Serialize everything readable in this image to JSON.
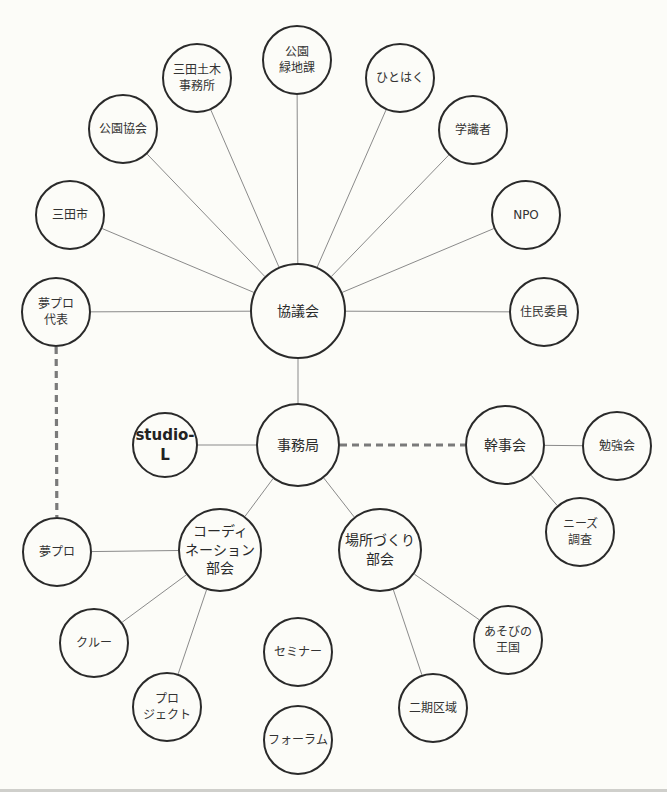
{
  "colors": {
    "background": "#fcfcf8",
    "node_border": "#2a2a2a",
    "solid_edge": "#8a8a8a",
    "dashed_edge": "#7a7a7a"
  },
  "nodes": [
    {
      "id": "kyogikai",
      "label": "協議会",
      "x": 298,
      "y": 311,
      "r": 48,
      "major": true
    },
    {
      "id": "jimukyoku",
      "label": "事務局",
      "x": 298,
      "y": 445,
      "r": 42,
      "major": true
    },
    {
      "id": "koen_ryokuchika",
      "label": "公園\n緑地課",
      "x": 297,
      "y": 60,
      "r": 35
    },
    {
      "id": "sanda_doboku",
      "label": "三田土木\n事務所",
      "x": 197,
      "y": 78,
      "r": 35
    },
    {
      "id": "koen_kyokai",
      "label": "公園協会",
      "x": 123,
      "y": 129,
      "r": 35
    },
    {
      "id": "sanda_shi",
      "label": "三田市",
      "x": 70,
      "y": 215,
      "r": 35
    },
    {
      "id": "yumepro_daihyo",
      "label": "夢プロ\n代表",
      "x": 56,
      "y": 312,
      "r": 35
    },
    {
      "id": "hitohaku",
      "label": "ひとはく",
      "x": 400,
      "y": 78,
      "r": 35
    },
    {
      "id": "gakushikisha",
      "label": "学識者",
      "x": 473,
      "y": 130,
      "r": 35
    },
    {
      "id": "npo",
      "label": "NPO",
      "x": 526,
      "y": 215,
      "r": 35
    },
    {
      "id": "jumin_iin",
      "label": "住民委員",
      "x": 544,
      "y": 312,
      "r": 35
    },
    {
      "id": "studio_l",
      "label": "studio-L",
      "x": 165,
      "y": 445,
      "r": 33,
      "bold": true
    },
    {
      "id": "kanjikai",
      "label": "幹事会",
      "x": 505,
      "y": 445,
      "r": 40,
      "major": true
    },
    {
      "id": "benkyokai",
      "label": "勉強会",
      "x": 617,
      "y": 446,
      "r": 35
    },
    {
      "id": "needs_chosa",
      "label": "ニーズ\n調査",
      "x": 580,
      "y": 532,
      "r": 35
    },
    {
      "id": "yumepro",
      "label": "夢プロ",
      "x": 57,
      "y": 552,
      "r": 35
    },
    {
      "id": "coordination_bukai",
      "label": "コーディ\nネーション\n部会",
      "x": 220,
      "y": 550,
      "r": 42,
      "major": true
    },
    {
      "id": "bashozukuri_bukai",
      "label": "場所づくり\n部会",
      "x": 380,
      "y": 550,
      "r": 42,
      "major": true
    },
    {
      "id": "crew",
      "label": "クルー",
      "x": 94,
      "y": 643,
      "r": 35
    },
    {
      "id": "project",
      "label": "プロ\nジェクト",
      "x": 167,
      "y": 707,
      "r": 35
    },
    {
      "id": "seminar",
      "label": "セミナー",
      "x": 298,
      "y": 652,
      "r": 35
    },
    {
      "id": "forum",
      "label": "フォーラム",
      "x": 298,
      "y": 740,
      "r": 35
    },
    {
      "id": "asobi_no_okoku",
      "label": "あそびの\n王国",
      "x": 508,
      "y": 640,
      "r": 35
    },
    {
      "id": "niki_kuiki",
      "label": "二期区域",
      "x": 433,
      "y": 708,
      "r": 35
    }
  ],
  "edges": [
    {
      "from": "kyogikai",
      "to": "koen_ryokuchika",
      "style": "solid"
    },
    {
      "from": "kyogikai",
      "to": "sanda_doboku",
      "style": "solid"
    },
    {
      "from": "kyogikai",
      "to": "koen_kyokai",
      "style": "solid"
    },
    {
      "from": "kyogikai",
      "to": "sanda_shi",
      "style": "solid"
    },
    {
      "from": "kyogikai",
      "to": "yumepro_daihyo",
      "style": "solid"
    },
    {
      "from": "kyogikai",
      "to": "hitohaku",
      "style": "solid"
    },
    {
      "from": "kyogikai",
      "to": "gakushikisha",
      "style": "solid"
    },
    {
      "from": "kyogikai",
      "to": "npo",
      "style": "solid"
    },
    {
      "from": "kyogikai",
      "to": "jumin_iin",
      "style": "solid"
    },
    {
      "from": "kyogikai",
      "to": "jimukyoku",
      "style": "solid"
    },
    {
      "from": "jimukyoku",
      "to": "studio_l",
      "style": "solid"
    },
    {
      "from": "jimukyoku",
      "to": "kanjikai",
      "style": "dashed"
    },
    {
      "from": "jimukyoku",
      "to": "coordination_bukai",
      "style": "solid"
    },
    {
      "from": "jimukyoku",
      "to": "bashozukuri_bukai",
      "style": "solid"
    },
    {
      "from": "kanjikai",
      "to": "benkyokai",
      "style": "solid"
    },
    {
      "from": "kanjikai",
      "to": "needs_chosa",
      "style": "solid"
    },
    {
      "from": "yumepro_daihyo",
      "to": "yumepro",
      "style": "dashed"
    },
    {
      "from": "coordination_bukai",
      "to": "yumepro",
      "style": "solid"
    },
    {
      "from": "coordination_bukai",
      "to": "crew",
      "style": "solid"
    },
    {
      "from": "coordination_bukai",
      "to": "project",
      "style": "solid"
    },
    {
      "from": "bashozukuri_bukai",
      "to": "asobi_no_okoku",
      "style": "solid"
    },
    {
      "from": "bashozukuri_bukai",
      "to": "niki_kuiki",
      "style": "solid"
    }
  ]
}
